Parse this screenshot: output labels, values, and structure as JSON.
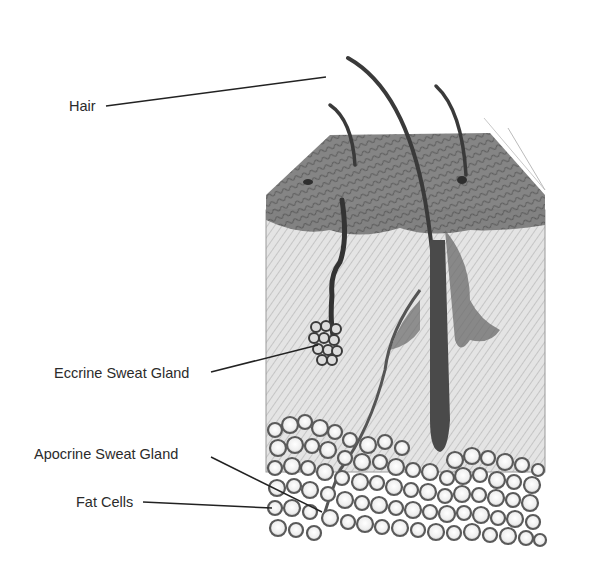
{
  "diagram": {
    "type": "anatomical cross-section",
    "labels": [
      {
        "id": "hair",
        "text": "Hair"
      },
      {
        "id": "eccrine",
        "text": "Eccrine Sweat Gland"
      },
      {
        "id": "apocrine",
        "text": "Apocrine Sweat  Gland"
      },
      {
        "id": "fat",
        "text": "Fat Cells"
      }
    ],
    "colors": {
      "background": "#ffffff",
      "epidermis": "#6e6e6e",
      "dermis": "#d9d9d9",
      "fat_outline": "#5a5a5a",
      "hair": "#3a3a3a",
      "label_text": "#2b2b2b"
    }
  }
}
